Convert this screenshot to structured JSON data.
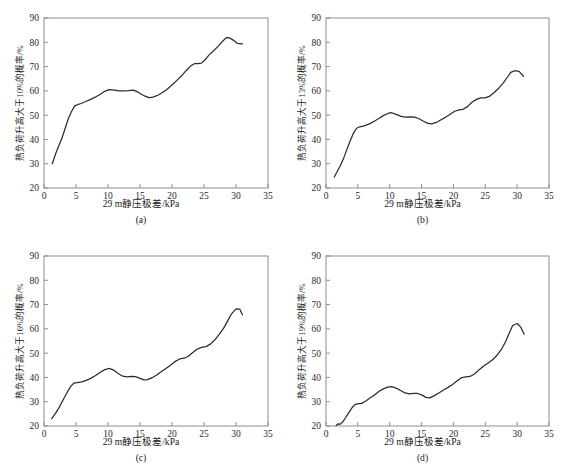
{
  "figure": {
    "panel_captions": [
      "(a)",
      "(b)",
      "(c)",
      "(d)"
    ],
    "xlabel": "29 m静压极差/kPa",
    "footnote": "",
    "line_color": "#2b2b2b",
    "axis_color": "#8e8e8e"
  },
  "chart_data": [
    {
      "type": "line",
      "panel": "(a)",
      "title": "",
      "xlabel": "29 m静压极差/kPa",
      "ylabel": "热负荷升高大于10%的概率/%",
      "xlim": [
        0,
        35
      ],
      "ylim": [
        20,
        90
      ],
      "xticks": [
        0,
        5,
        10,
        15,
        20,
        25,
        30,
        35
      ],
      "yticks": [
        20,
        30,
        40,
        50,
        60,
        70,
        80,
        90
      ],
      "grid": false,
      "legend": "none",
      "x": [
        1.3,
        1.8,
        2.3,
        2.8,
        3.3,
        3.8,
        4.3,
        4.8,
        5.2,
        5.8,
        6.5,
        7.2,
        8.0,
        8.8,
        9.5,
        10.2,
        11.0,
        11.8,
        12.5,
        13.2,
        14.0,
        14.6,
        15.2,
        15.8,
        16.4,
        17.0,
        17.8,
        18.5,
        19.2,
        20.0,
        20.8,
        21.5,
        22.2,
        22.9,
        23.5,
        24.0,
        24.6,
        25.2,
        25.8,
        26.5,
        27.2,
        27.9,
        28.5,
        29.0,
        29.5,
        30.2,
        31.0
      ],
      "y": [
        30.0,
        34.0,
        37.3,
        40.5,
        44.5,
        48.5,
        51.5,
        53.8,
        54.3,
        54.8,
        55.6,
        56.4,
        57.4,
        58.6,
        59.8,
        60.5,
        60.3,
        60.0,
        60.0,
        60.1,
        60.3,
        59.6,
        58.6,
        57.8,
        57.2,
        57.4,
        58.2,
        59.3,
        60.6,
        62.4,
        64.4,
        66.2,
        68.3,
        70.2,
        71.2,
        71.2,
        71.4,
        72.9,
        74.8,
        76.5,
        78.3,
        80.4,
        81.9,
        81.8,
        81.0,
        79.6,
        79.3
      ]
    },
    {
      "type": "line",
      "panel": "(b)",
      "title": "",
      "xlabel": "29 m静压极差/kPa",
      "ylabel": "热负荷升高大于13%的概率/%",
      "xlim": [
        0,
        35
      ],
      "ylim": [
        20,
        90
      ],
      "xticks": [
        0,
        5,
        10,
        15,
        20,
        25,
        30,
        35
      ],
      "yticks": [
        20,
        30,
        40,
        50,
        60,
        70,
        80,
        90
      ],
      "grid": false,
      "legend": "none",
      "x": [
        1.3,
        1.8,
        2.3,
        2.8,
        3.3,
        3.8,
        4.3,
        4.8,
        5.3,
        6.0,
        6.8,
        7.5,
        8.3,
        9.0,
        9.7,
        10.3,
        11.0,
        11.8,
        12.5,
        13.2,
        13.9,
        14.6,
        15.3,
        16.0,
        16.6,
        17.3,
        18.0,
        18.8,
        19.5,
        20.2,
        20.9,
        21.5,
        22.2,
        22.9,
        23.6,
        24.3,
        25.0,
        25.7,
        26.4,
        27.1,
        27.8,
        28.4,
        29.0,
        29.6,
        30.3,
        31.0
      ],
      "y": [
        24.5,
        27.0,
        29.5,
        32.5,
        36.0,
        39.5,
        42.5,
        44.6,
        45.2,
        45.6,
        46.4,
        47.4,
        48.6,
        49.8,
        50.7,
        51.0,
        50.3,
        49.5,
        49.2,
        49.3,
        49.2,
        48.5,
        47.5,
        46.6,
        46.4,
        47.0,
        48.0,
        49.2,
        50.4,
        51.6,
        52.2,
        52.4,
        53.5,
        55.3,
        56.5,
        57.1,
        57.1,
        57.8,
        59.3,
        61.1,
        63.2,
        65.4,
        67.6,
        68.3,
        68.0,
        66.0
      ]
    },
    {
      "type": "line",
      "panel": "(c)",
      "title": "",
      "xlabel": "29 m静压极差/kPa",
      "ylabel": "热负荷升高大于16%的概率/%",
      "xlim": [
        0,
        35
      ],
      "ylim": [
        20,
        90
      ],
      "xticks": [
        0,
        5,
        10,
        15,
        20,
        25,
        30,
        35
      ],
      "yticks": [
        20,
        30,
        40,
        50,
        60,
        70,
        80,
        90
      ],
      "grid": false,
      "legend": "none",
      "x": [
        1.2,
        1.8,
        2.4,
        3.0,
        3.6,
        4.2,
        4.7,
        5.2,
        5.9,
        6.6,
        7.3,
        8.0,
        8.8,
        9.5,
        10.2,
        10.9,
        11.6,
        12.3,
        13.0,
        13.7,
        14.3,
        15.0,
        15.6,
        16.2,
        16.9,
        17.6,
        18.3,
        19.0,
        19.8,
        20.5,
        21.2,
        21.9,
        22.5,
        23.2,
        23.9,
        24.6,
        25.3,
        26.0,
        26.7,
        27.4,
        28.1,
        28.7,
        29.3,
        30.0,
        30.6,
        31.0
      ],
      "y": [
        23.0,
        25.2,
        27.8,
        30.8,
        33.8,
        36.4,
        37.7,
        37.9,
        38.2,
        38.8,
        39.6,
        40.7,
        42.1,
        43.2,
        43.7,
        43.0,
        41.6,
        40.5,
        40.2,
        40.4,
        40.3,
        39.6,
        39.0,
        39.1,
        39.9,
        41.0,
        42.3,
        43.6,
        45.1,
        46.6,
        47.6,
        47.9,
        48.6,
        50.2,
        51.6,
        52.4,
        52.7,
        53.7,
        55.5,
        57.8,
        60.4,
        63.3,
        66.2,
        68.2,
        68.1,
        65.8
      ]
    },
    {
      "type": "line",
      "panel": "(d)",
      "title": "",
      "xlabel": "29 m静压极差/kPa",
      "ylabel": "热负荷升高大于19%的概率/%",
      "xlim": [
        0,
        35
      ],
      "ylim": [
        20,
        90
      ],
      "xticks": [
        0,
        5,
        10,
        15,
        20,
        25,
        30,
        35
      ],
      "yticks": [
        20,
        30,
        40,
        50,
        60,
        70,
        80,
        90
      ],
      "grid": false,
      "legend": "none",
      "x": [
        1.6,
        1.9,
        2.2,
        2.6,
        3.1,
        3.6,
        4.1,
        4.6,
        5.1,
        5.6,
        6.2,
        6.9,
        7.6,
        8.3,
        9.0,
        9.7,
        10.3,
        11.0,
        11.7,
        12.4,
        13.1,
        13.8,
        14.4,
        15.1,
        15.7,
        16.3,
        17.0,
        17.7,
        18.4,
        19.1,
        19.8,
        20.5,
        21.2,
        21.9,
        22.6,
        23.3,
        24.0,
        24.7,
        25.4,
        26.1,
        26.8,
        27.5,
        28.2,
        28.8,
        29.3,
        30.0,
        30.6,
        31.1
      ],
      "y": [
        20.2,
        20.9,
        20.7,
        21.6,
        23.5,
        25.6,
        27.6,
        28.9,
        29.2,
        29.3,
        30.2,
        31.5,
        32.8,
        34.2,
        35.3,
        36.0,
        36.2,
        35.6,
        34.6,
        33.6,
        33.2,
        33.4,
        33.4,
        32.7,
        31.8,
        31.6,
        32.5,
        33.6,
        34.7,
        35.8,
        37.0,
        38.4,
        39.8,
        40.2,
        40.4,
        41.4,
        43.1,
        44.6,
        45.8,
        47.2,
        49.0,
        51.4,
        54.8,
        58.5,
        61.4,
        62.2,
        60.6,
        57.8
      ]
    }
  ]
}
